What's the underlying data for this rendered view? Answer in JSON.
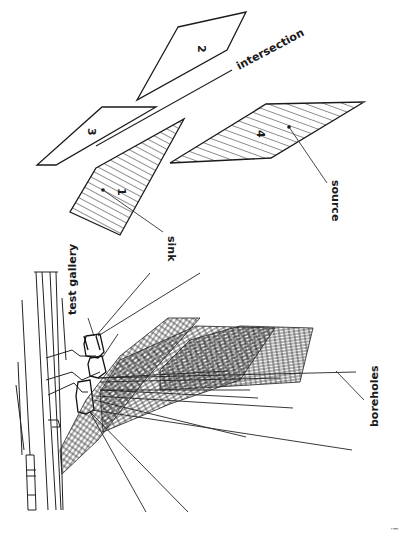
{
  "figure": {
    "orientation": "rotated 90 degrees clockwise",
    "background": "#ffffff",
    "ink_color": "#1a1a1a"
  },
  "labels": {
    "test_gallery": "test gallery",
    "boreholes": "boreholes",
    "sink": "sink",
    "source": "source",
    "intersection": "intersection"
  },
  "planes": [
    {
      "id": "1",
      "label": "1",
      "hatched": true,
      "role": "sink plane"
    },
    {
      "id": "2",
      "label": "2",
      "hatched": false
    },
    {
      "id": "3",
      "label": "3",
      "hatched": false
    },
    {
      "id": "4",
      "label": "4",
      "hatched": true,
      "role": "source plane"
    }
  ],
  "margin_mark": "i"
}
